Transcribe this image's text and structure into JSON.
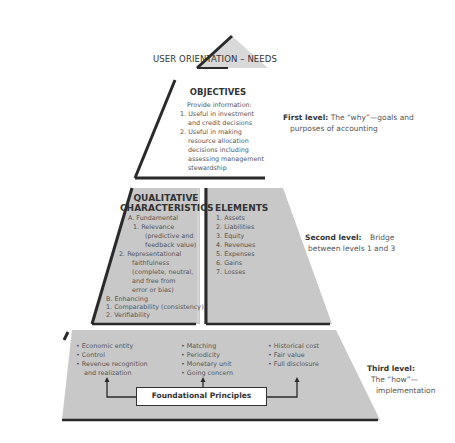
{
  "apex": {
    "label": "USER ORIENTATION – NEEDS"
  },
  "objectives": {
    "heading": "OBJECTIVES",
    "lines": [
      "Provide information:",
      "1. Useful in investment",
      "   and credit decisions",
      "2. Useful in making",
      "   resource allocation",
      "   decisions including",
      "   assessing management",
      "   stewardship"
    ]
  },
  "qualitative": {
    "heading_1": "QUALITATIVE",
    "heading_2": "CHARACTERISTICS",
    "lines": [
      "A. Fundamental",
      "1. Relevance",
      "(predictive and",
      "feedback value)",
      "2. Representational",
      "faithfulness",
      "(complete, neutral,",
      "and free from",
      "error or bias)",
      "B. Enhancing",
      "1. Comparability (consistency)",
      "2. Verifiability",
      "3. Timeliness",
      "4. Understandability"
    ]
  },
  "elements": {
    "heading": "ELEMENTS",
    "items": [
      "1. Assets",
      "2. Liabilities",
      "3. Equity",
      "4. Revenues",
      "5. Expenses",
      "6. Gains",
      "7. Losses"
    ]
  },
  "foundation": {
    "col1": [
      "• Economic entity",
      "• Control",
      "• Revenue recognition",
      "  and realization"
    ],
    "col2": [
      "• Matching",
      "• Periodicity",
      "• Monetary unit",
      "• Going concern"
    ],
    "col3": [
      "• Historical cost",
      "• Fair value",
      "• Full disclosure"
    ],
    "box_label": "Foundational Principles"
  },
  "levels": {
    "first": {
      "label": "First level:",
      "text_1": "The “why”—goals and",
      "text_2": "purposes of accounting"
    },
    "second": {
      "label": "Second level:",
      "text_1": "Bridge",
      "text_2": "between levels 1 and 3"
    },
    "third": {
      "label": "Third level:",
      "text_1": "The “how”—",
      "text_2": "implementation"
    }
  },
  "colors": {
    "fill": "#c8c8c8",
    "edge": "#2a2a2a",
    "apex_fill": "#d6d6d6"
  }
}
